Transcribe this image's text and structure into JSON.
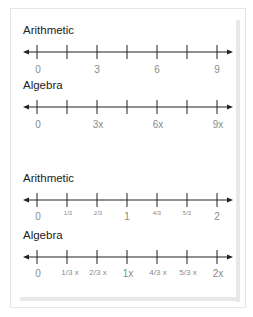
{
  "sections": [
    {
      "title": "Arithmetic",
      "labels": [
        "0",
        "3",
        "6",
        "9"
      ]
    },
    {
      "title": "Algebra",
      "labels": [
        "0",
        "3x",
        "6x",
        "9x"
      ]
    },
    {
      "title": "Arithmetic",
      "labels": [
        "0",
        "1/3",
        "2/3",
        "1",
        "4/3",
        "5/3",
        "2"
      ]
    },
    {
      "title": "Algebra",
      "labels": [
        "0",
        "1/3 x",
        "2/3 x",
        "1x",
        "4/3 x",
        "5/3 x",
        "2x"
      ]
    }
  ],
  "colors": {
    "line": "#222222",
    "label": "#8a8a8a",
    "frame": "#e6e6e6"
  }
}
